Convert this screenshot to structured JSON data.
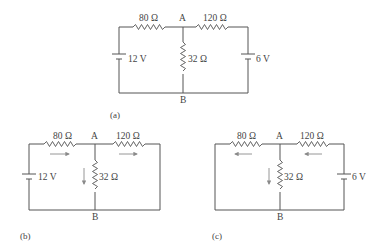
{
  "figures": [
    {
      "id": "a",
      "caption": "(a)",
      "node_top": "A",
      "node_bottom": "B",
      "r_left": "80 Ω",
      "r_right": "120 Ω",
      "r_mid": "32 Ω",
      "source_left": "12 V",
      "source_right": "6 V"
    },
    {
      "id": "b",
      "caption": "(b)",
      "node_top": "A",
      "node_bottom": "B",
      "r_left": "80 Ω",
      "r_right": "120 Ω",
      "r_mid": "32 Ω",
      "source_left": "12 V",
      "current_arrows": [
        "right",
        "right",
        "down"
      ]
    },
    {
      "id": "c",
      "caption": "(c)",
      "node_top": "A",
      "node_bottom": "B",
      "r_left": "80 Ω",
      "r_right": "120 Ω",
      "r_mid": "32 Ω",
      "source_right": "6 V",
      "current_arrows": [
        "left",
        "left",
        "down"
      ]
    }
  ],
  "colors": {
    "wire": "#555555",
    "arrow": "#8a8a8a",
    "text": "#444444"
  }
}
